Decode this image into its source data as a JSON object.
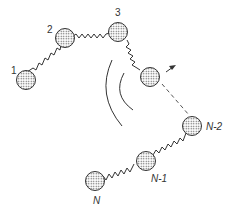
{
  "diagram": {
    "labels": {
      "b1": "1",
      "b2": "2",
      "b3": "3",
      "bNm2": "N-2",
      "bNm1": "N-1",
      "bN": "N"
    },
    "colors": {
      "stroke": "#333333",
      "fill": "#bbbbbb"
    }
  }
}
